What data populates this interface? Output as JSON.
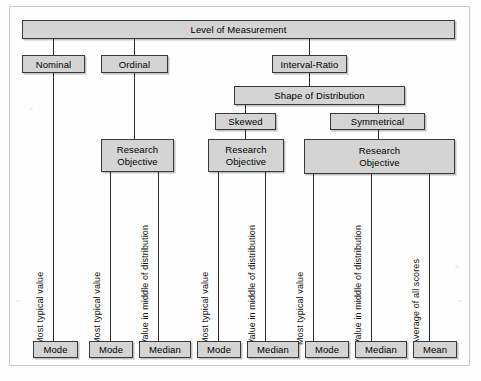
{
  "diagram": {
    "root": {
      "label": "Level of Measurement"
    },
    "levels": [
      {
        "label": "Nominal"
      },
      {
        "label": "Ordinal"
      },
      {
        "label": "Interval-Ratio"
      }
    ],
    "shape": {
      "label": "Shape of Distribution"
    },
    "shapes": [
      {
        "label": "Skewed"
      },
      {
        "label": "Symmetrical"
      }
    ],
    "objectives": [
      {
        "line1": "Research",
        "line2": "Objective"
      },
      {
        "line1": "Research",
        "line2": "Objective"
      },
      {
        "line1": "Research",
        "line2": "Objective"
      }
    ],
    "descriptors": [
      {
        "label": "Most typical value"
      },
      {
        "label": "Most typical value"
      },
      {
        "label": "Value in middle of distribution"
      },
      {
        "label": "Most typical value"
      },
      {
        "label": "Value in middle of distribution"
      },
      {
        "label": "Most typical value"
      },
      {
        "label": "Value in middle of distribution"
      },
      {
        "label": "Average of all scores"
      }
    ],
    "statistics": [
      {
        "label": "Mode"
      },
      {
        "label": "Mode"
      },
      {
        "label": "Median"
      },
      {
        "label": "Mode"
      },
      {
        "label": "Median"
      },
      {
        "label": "Mode"
      },
      {
        "label": "Median"
      },
      {
        "label": "Mean"
      }
    ],
    "colors": {
      "box_fill": "#d4d4d4",
      "box_border": "#3a3a3a",
      "line": "#2b2b2b",
      "text": "#000000",
      "page": "#fdfdfd"
    }
  }
}
